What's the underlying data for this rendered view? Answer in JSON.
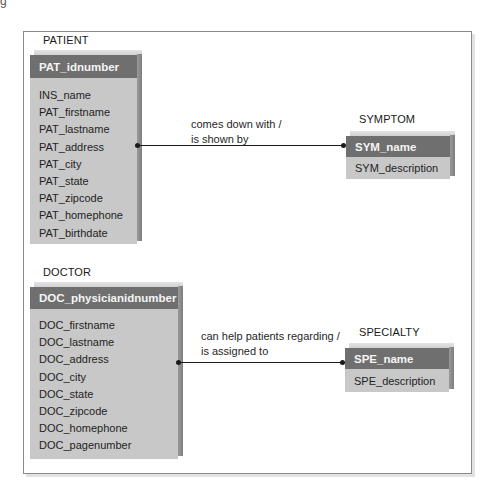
{
  "corner_text": "g",
  "entities": {
    "patient": {
      "label": "PATIENT",
      "key": "PAT_idnumber",
      "attributes": [
        "INS_name",
        "PAT_firstname",
        "PAT_lastname",
        "PAT_address",
        "PAT_city",
        "PAT_state",
        "PAT_zipcode",
        "PAT_homephone",
        "PAT_birthdate"
      ]
    },
    "symptom": {
      "label": "SYMPTOM",
      "key": "SYM_name",
      "attributes": [
        "SYM_description"
      ]
    },
    "doctor": {
      "label": "DOCTOR",
      "key": "DOC_physicianidnumber",
      "attributes": [
        "DOC_firstname",
        "DOC_lastname",
        "DOC_address",
        "DOC_city",
        "DOC_state",
        "DOC_zipcode",
        "DOC_homephone",
        "DOC_pagenumber"
      ]
    },
    "specialty": {
      "label": "SPECIALTY",
      "key": "SPE_name",
      "attributes": [
        "SPE_description"
      ]
    }
  },
  "relationships": [
    {
      "from": "PATIENT",
      "to": "SYMPTOM",
      "label_line1": "comes down with /",
      "label_line2": "is shown by"
    },
    {
      "from": "DOCTOR",
      "to": "SPECIALTY",
      "label_line1": "can help patients regarding /",
      "label_line2": "is assigned to"
    }
  ],
  "colors": {
    "header_bg": "#6f6f6f",
    "body_bg": "#c8c8c8",
    "line": "#1a1a1a",
    "frame": "#8a8a8a"
  }
}
